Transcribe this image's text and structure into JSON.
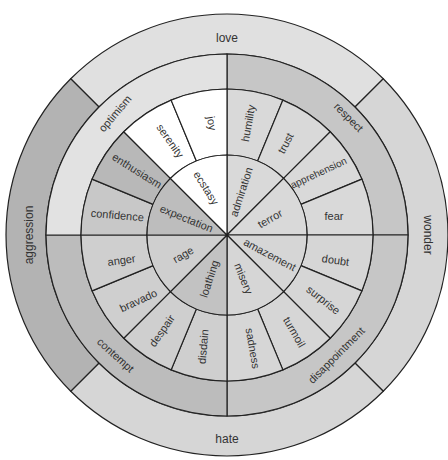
{
  "diagram": {
    "center": [
      227,
      235
    ],
    "radii": [
      0,
      80,
      146,
      181,
      221
    ],
    "colors": {
      "white": "#ffffff",
      "light": "#d9d9d9",
      "lighter": "#e4e4e4",
      "mid": "#bdbdbd",
      "dark": "#b0b0b0",
      "line": "#222222",
      "text": "#333333"
    },
    "rings": [
      {
        "name": "inner",
        "segments": [
          {
            "label": "admiration",
            "start": 0,
            "end": 45,
            "fill": "#d9d9d9"
          },
          {
            "label": "terror",
            "start": 45,
            "end": 90,
            "fill": "#d9d9d9"
          },
          {
            "label": "amazement",
            "start": 90,
            "end": 135,
            "fill": "#d6d6d6"
          },
          {
            "label": "misery",
            "start": 135,
            "end": 180,
            "fill": "#d6d6d6"
          },
          {
            "label": "loathing",
            "start": 180,
            "end": 225,
            "fill": "#c2c2c2"
          },
          {
            "label": "rage",
            "start": 225,
            "end": 270,
            "fill": "#cfcfcf"
          },
          {
            "label": "expectation",
            "start": 270,
            "end": 315,
            "fill": "#bdbdbd"
          },
          {
            "label": "ecstasy",
            "start": 315,
            "end": 360,
            "fill": "#ffffff"
          }
        ]
      },
      {
        "name": "middle",
        "segments": [
          {
            "label": "humility",
            "start": 0,
            "end": 22.5,
            "fill": "#d9d9d9"
          },
          {
            "label": "trust",
            "start": 22.5,
            "end": 45,
            "fill": "#d9d9d9"
          },
          {
            "label": "apprehension",
            "start": 45,
            "end": 67.5,
            "fill": "#d9d9d9"
          },
          {
            "label": "fear",
            "start": 67.5,
            "end": 90,
            "fill": "#d9d9d9"
          },
          {
            "label": "doubt",
            "start": 90,
            "end": 112.5,
            "fill": "#d6d6d6"
          },
          {
            "label": "surprise",
            "start": 112.5,
            "end": 135,
            "fill": "#d6d6d6"
          },
          {
            "label": "turmoil",
            "start": 135,
            "end": 157.5,
            "fill": "#d6d6d6"
          },
          {
            "label": "sadness",
            "start": 157.5,
            "end": 180,
            "fill": "#d6d6d6"
          },
          {
            "label": "disdain",
            "start": 180,
            "end": 202.5,
            "fill": "#cfcfcf"
          },
          {
            "label": "despair",
            "start": 202.5,
            "end": 225,
            "fill": "#cfcfcf"
          },
          {
            "label": "bravado",
            "start": 225,
            "end": 247.5,
            "fill": "#cfcfcf"
          },
          {
            "label": "anger",
            "start": 247.5,
            "end": 270,
            "fill": "#cfcfcf"
          },
          {
            "label": "confidence",
            "start": 270,
            "end": 292.5,
            "fill": "#c8c8c8"
          },
          {
            "label": "enthusiasm",
            "start": 292.5,
            "end": 315,
            "fill": "#b8b8b8"
          },
          {
            "label": "serenity",
            "start": 315,
            "end": 337.5,
            "fill": "#ffffff"
          },
          {
            "label": "joy",
            "start": 337.5,
            "end": 360,
            "fill": "#ffffff"
          }
        ]
      },
      {
        "name": "dyad",
        "segments": [
          {
            "label": "respect",
            "start": 0,
            "end": 90,
            "fill": "#c6c6c6"
          },
          {
            "label": "disappointment",
            "start": 90,
            "end": 180,
            "fill": "#c6c6c6"
          },
          {
            "label": "contempt",
            "start": 180,
            "end": 270,
            "fill": "#bcbcbc"
          },
          {
            "label": "optimism",
            "start": 270,
            "end": 360,
            "fill": "#e2e2e2"
          }
        ]
      },
      {
        "name": "outer",
        "segments": [
          {
            "label": "love",
            "start": -45,
            "end": 45,
            "fill": "#e0e0e0"
          },
          {
            "label": "wonder",
            "start": 45,
            "end": 135,
            "fill": "#d6d6d6"
          },
          {
            "label": "hate",
            "start": 135,
            "end": 225,
            "fill": "#d6d6d6"
          },
          {
            "label": "aggression",
            "start": 225,
            "end": 315,
            "fill": "#b3b3b3"
          }
        ]
      }
    ],
    "labels": {
      "inner": {
        "ecstasy": "ecstasy",
        "admiration": "admiration",
        "terror": "terror",
        "amazement": "amazement",
        "misery": "misery",
        "loathing": "loathing",
        "rage": "rage",
        "expectation": "expectation"
      },
      "middle": {
        "humility": "humility",
        "trust": "trust",
        "apprehension": "apprehension",
        "fear": "fear",
        "doubt": "doubt",
        "surprise": "surprise",
        "turmoil": "turmoil",
        "sadness": "sadness",
        "disdain": "disdain",
        "despair": "despair",
        "bravado": "bravado",
        "anger": "anger",
        "confidence": "confidence",
        "enthusiasm": "enthusiasm",
        "serenity": "serenity",
        "joy": "joy"
      },
      "dyad": {
        "respect": "respect",
        "disappointment": "disappointment",
        "contempt": "contempt",
        "optimism": "optimism"
      },
      "outer": {
        "love": "love",
        "wonder": "wonder",
        "hate": "hate",
        "aggression": "aggression"
      }
    }
  }
}
